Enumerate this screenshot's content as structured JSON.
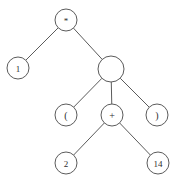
{
  "diagram": {
    "type": "tree",
    "title": "",
    "background_color": "#ffffff",
    "stroke_color": "#5b5b5b",
    "label_color": "#2e2e2e",
    "nodes": [
      {
        "id": "n0",
        "label": "*",
        "x": 66,
        "y": 20,
        "r": 11,
        "font_size": 9,
        "level": 0
      },
      {
        "id": "n1",
        "label": "1",
        "x": 18,
        "y": 68,
        "r": 11,
        "font_size": 9,
        "level": 1
      },
      {
        "id": "n2",
        "label": "",
        "x": 111,
        "y": 69,
        "r": 13,
        "font_size": 9,
        "level": 1
      },
      {
        "id": "n3",
        "label": "(",
        "x": 66,
        "y": 115,
        "r": 11,
        "font_size": 10,
        "level": 2
      },
      {
        "id": "n4",
        "label": "+",
        "x": 112,
        "y": 115,
        "r": 11,
        "font_size": 10,
        "level": 2
      },
      {
        "id": "n5",
        "label": ")",
        "x": 157,
        "y": 115,
        "r": 11,
        "font_size": 10,
        "level": 2
      },
      {
        "id": "n6",
        "label": "2",
        "x": 66,
        "y": 163,
        "r": 11,
        "font_size": 9,
        "level": 3
      },
      {
        "id": "n7",
        "label": "14",
        "x": 158,
        "y": 163,
        "r": 11,
        "font_size": 9,
        "level": 3
      }
    ],
    "edges": [
      {
        "from": "n0",
        "to": "n1"
      },
      {
        "from": "n0",
        "to": "n2"
      },
      {
        "from": "n2",
        "to": "n3"
      },
      {
        "from": "n2",
        "to": "n4"
      },
      {
        "from": "n2",
        "to": "n5"
      },
      {
        "from": "n4",
        "to": "n6"
      },
      {
        "from": "n4",
        "to": "n7"
      }
    ]
  }
}
